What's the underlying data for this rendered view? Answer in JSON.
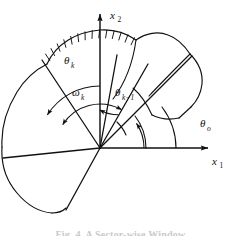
{
  "figure": {
    "type": "geometry-diagram",
    "background_color": "#ffffff",
    "stroke_color": "#111111"
  },
  "axes": {
    "origin": {
      "x": 100,
      "y": 148
    },
    "x1": {
      "label": "x",
      "subscript": "1",
      "direction": "right",
      "label_x": 218,
      "label_y": 162,
      "arrow_tip": {
        "x": 212,
        "y": 148
      }
    },
    "x2": {
      "label": "x",
      "subscript": "2",
      "direction": "up",
      "label_x": 110,
      "label_y": 16,
      "arrow_tip": {
        "x": 100,
        "y": 10
      }
    }
  },
  "angle_labels": [
    {
      "name": "theta-k",
      "symbol": "θ",
      "subscript": "k",
      "subscript_style": "italic",
      "x": 68,
      "y": 61,
      "measured_from": "x2-axis",
      "measured_to": "sector-ray-theta-k"
    },
    {
      "name": "omega-k",
      "symbol": "ω",
      "subscript": "k",
      "subscript_style": "italic",
      "x": 76,
      "y": 93,
      "measured_from": "sector-ray-theta-k",
      "measured_to": "sector-ray-theta-k-minus-1"
    },
    {
      "name": "theta-k-minus-1",
      "symbol": "θ",
      "subscript": "k−1",
      "subscript_style": "italic",
      "x": 119,
      "y": 96,
      "measured_from": "x2-axis",
      "measured_to": "sector-ray-theta-k-minus-1"
    },
    {
      "name": "theta-o",
      "symbol": "θ",
      "subscript": "o",
      "subscript_style": "italic",
      "x": 204,
      "y": 124,
      "measured_from": "x1-axis",
      "measured_to": "sector-ray-theta-o"
    }
  ],
  "sector_rays": [
    {
      "name": "sector-ray-theta-k",
      "angle_deg": 148,
      "length": 104
    },
    {
      "name": "sector-ray-theta-k-minus-1",
      "angle_deg": 61,
      "length": 96
    },
    {
      "name": "sector-ray-theta-o",
      "angle_deg": 34,
      "length": 110
    },
    {
      "name": "sector-ray-upper-mid",
      "angle_deg": 79,
      "length": 95
    },
    {
      "name": "sector-ray-left",
      "angle_deg": 186,
      "length": 98
    },
    {
      "name": "sector-ray-lower-left",
      "angle_deg": 250,
      "length": 92
    }
  ],
  "angle_arcs": [
    {
      "name": "arc-theta-k",
      "radius": 62,
      "start_deg": 90,
      "end_deg": 148,
      "arrows": "end"
    },
    {
      "name": "arc-omega-k",
      "radius": 44,
      "start_deg": 61,
      "end_deg": 148,
      "arrows": "both"
    },
    {
      "name": "arc-theta-k-minus-1",
      "radius": 38,
      "start_deg": 61,
      "end_deg": 90,
      "arrows": "start"
    },
    {
      "name": "arc-theta-o",
      "radius": 44,
      "start_deg": 0,
      "end_deg": 34,
      "arrows": "end"
    }
  ],
  "boundary_arcs": [
    {
      "name": "boundary-arc-hatched",
      "hatched": true,
      "note": "upper-left outer boundary with hatch ticks"
    },
    {
      "name": "boundary-arc-upper",
      "hatched": false
    },
    {
      "name": "boundary-arc-right",
      "hatched": false
    }
  ],
  "caption": {
    "text": "Fig. 4.   A Sector-wise Window",
    "visible": "partially-cropped"
  }
}
